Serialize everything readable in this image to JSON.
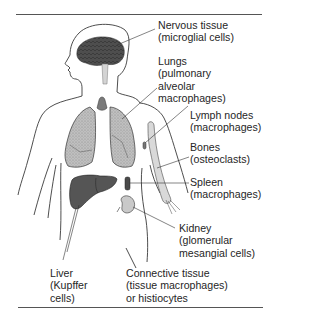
{
  "diagram": {
    "labels": {
      "nervous": [
        "Nervous tissue",
        "(microglial cells)"
      ],
      "lungs": [
        "Lungs",
        "(pulmonary",
        "alveolar",
        "macrophages)"
      ],
      "lymph": [
        "Lymph nodes",
        "(macrophages)"
      ],
      "bones": [
        "Bones",
        "(osteoclasts)"
      ],
      "spleen": [
        "Spleen",
        "(macrophages)"
      ],
      "kidney": [
        "Kidney",
        "(glomerular",
        "mesangial cells)"
      ],
      "liver": [
        "Liver",
        "(Kupffer",
        "cells)"
      ],
      "connective": [
        "Connective tissue",
        "(tissue macrophages)",
        "or histiocytes"
      ]
    },
    "colors": {
      "outline": "#3a3a3a",
      "brain": "#4a4a4a",
      "lungs": "#b8b8b8",
      "liver": "#555555",
      "kidney": "#bdbdbd",
      "bone": "#d6d6d6",
      "rule": "#555555"
    }
  }
}
